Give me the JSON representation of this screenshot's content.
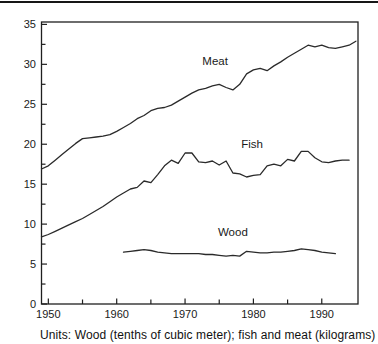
{
  "caption": "Units: Wood (tenths of cubic meter); fish and meat (kilograms)",
  "colors": {
    "background": "#ffffff",
    "line": "#2a2a2a",
    "axis": "#1f1f1f",
    "text": "#1a1a1a",
    "top_rule": "#161616"
  },
  "chart_data": {
    "type": "line",
    "title": "",
    "xlabel": "",
    "ylabel": "",
    "xlim": [
      1949,
      1995.3
    ],
    "ylim": [
      0,
      35.3
    ],
    "grid": false,
    "legend": "inline-labels",
    "x_major_ticks": [
      1950,
      1960,
      1970,
      1980,
      1990
    ],
    "x_minor_ticks": [
      1955,
      1965,
      1975,
      1985
    ],
    "y_major_ticks": [
      0,
      5,
      10,
      15,
      20,
      25,
      30,
      35
    ],
    "y_minor_ticks": [
      2.5,
      7.5,
      12.5,
      17.5,
      22.5,
      27.5,
      32.5
    ],
    "series": [
      {
        "name": "Meat",
        "label_pos": {
          "year": 1974.4,
          "value": 30.4
        },
        "years": [
          1949,
          1950,
          1951,
          1952,
          1953,
          1954,
          1955,
          1956,
          1957,
          1958,
          1959,
          1960,
          1961,
          1962,
          1963,
          1964,
          1965,
          1966,
          1967,
          1968,
          1969,
          1970,
          1971,
          1972,
          1973,
          1974,
          1975,
          1976,
          1977,
          1978,
          1979,
          1980,
          1981,
          1982,
          1983,
          1984,
          1985,
          1986,
          1987,
          1988,
          1989,
          1990,
          1991,
          1992,
          1993,
          1994,
          1995
        ],
        "values": [
          16.9,
          17.3,
          18.0,
          18.7,
          19.4,
          20.1,
          20.7,
          20.8,
          20.9,
          21.0,
          21.2,
          21.6,
          22.1,
          22.6,
          23.2,
          23.6,
          24.2,
          24.5,
          24.6,
          24.9,
          25.4,
          25.9,
          26.4,
          26.8,
          27.0,
          27.3,
          27.5,
          27.1,
          26.8,
          27.5,
          28.8,
          29.3,
          29.5,
          29.2,
          29.8,
          30.3,
          30.9,
          31.4,
          31.9,
          32.4,
          32.2,
          32.4,
          32.1,
          32.0,
          32.2,
          32.4,
          32.9
        ]
      },
      {
        "name": "Fish",
        "label_pos": {
          "year": 1979.8,
          "value": 20.0
        },
        "years": [
          1949,
          1950,
          1951,
          1952,
          1953,
          1954,
          1955,
          1956,
          1957,
          1958,
          1959,
          1960,
          1961,
          1962,
          1963,
          1964,
          1965,
          1966,
          1967,
          1968,
          1969,
          1970,
          1971,
          1972,
          1973,
          1974,
          1975,
          1976,
          1977,
          1978,
          1979,
          1980,
          1981,
          1982,
          1983,
          1984,
          1985,
          1986,
          1987,
          1988,
          1989,
          1990,
          1991,
          1992,
          1993,
          1994
        ],
        "values": [
          8.4,
          8.7,
          9.1,
          9.5,
          9.9,
          10.3,
          10.7,
          11.2,
          11.7,
          12.2,
          12.8,
          13.4,
          13.9,
          14.4,
          14.6,
          15.4,
          15.2,
          16.2,
          17.3,
          18.0,
          17.6,
          18.9,
          18.9,
          17.8,
          17.7,
          17.9,
          17.4,
          17.9,
          16.4,
          16.3,
          15.9,
          16.1,
          16.2,
          17.3,
          17.5,
          17.3,
          18.1,
          17.9,
          19.1,
          19.1,
          18.3,
          17.8,
          17.7,
          17.9,
          18.0,
          18.0
        ]
      },
      {
        "name": "Wood",
        "label_pos": {
          "year": 1977.0,
          "value": 9.0
        },
        "years": [
          1961,
          1962,
          1963,
          1964,
          1965,
          1966,
          1967,
          1968,
          1969,
          1970,
          1971,
          1972,
          1973,
          1974,
          1975,
          1976,
          1977,
          1978,
          1979,
          1980,
          1981,
          1982,
          1983,
          1984,
          1985,
          1986,
          1987,
          1988,
          1989,
          1990,
          1991,
          1992
        ],
        "values": [
          6.5,
          6.6,
          6.7,
          6.8,
          6.7,
          6.5,
          6.4,
          6.3,
          6.3,
          6.3,
          6.3,
          6.3,
          6.2,
          6.2,
          6.1,
          6.0,
          6.1,
          6.0,
          6.6,
          6.5,
          6.4,
          6.4,
          6.5,
          6.5,
          6.6,
          6.7,
          6.9,
          6.8,
          6.7,
          6.5,
          6.4,
          6.3
        ]
      }
    ]
  }
}
